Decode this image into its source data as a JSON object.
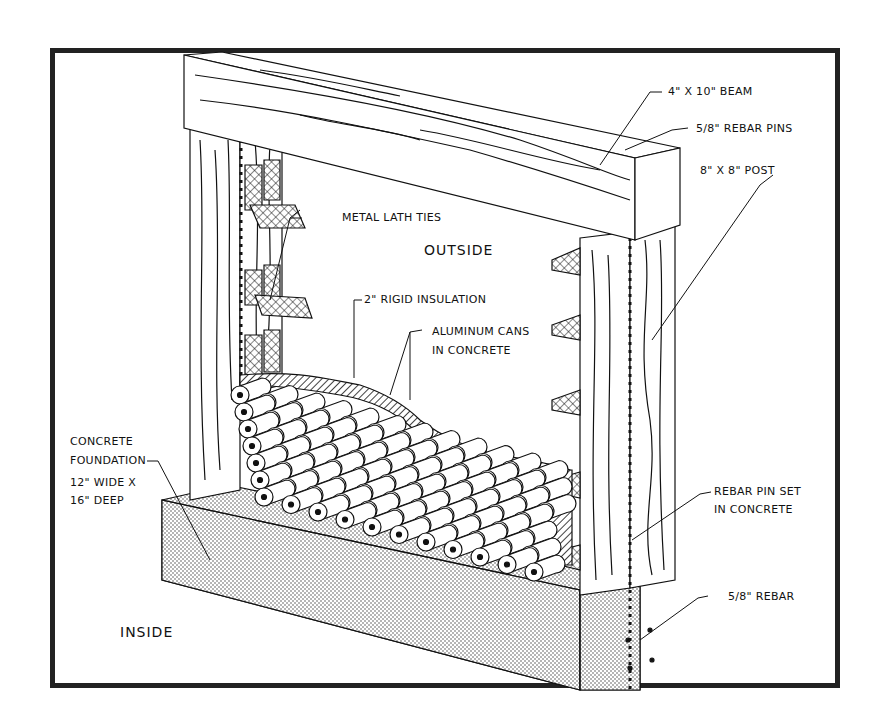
{
  "diagram": {
    "labels": {
      "beam": "4\" X 10\" BEAM",
      "rebar_pins": "5/8\" REBAR PINS",
      "post": "8\" X 8\" POST",
      "metal_lath_ties": "METAL LATH TIES",
      "outside": "OUTSIDE",
      "rigid_insulation": "2\" RIGID INSULATION",
      "aluminum_cans_line1": "ALUMINUM CANS",
      "aluminum_cans_line2": "IN CONCRETE",
      "foundation_line1": "CONCRETE",
      "foundation_line2": "FOUNDATION",
      "foundation_dim1": "12\" WIDE X",
      "foundation_dim2": "16\" DEEP",
      "rebar_pin_set_line1": "REBAR PIN SET",
      "rebar_pin_set_line2": "IN CONCRETE",
      "rebar": "5/8\" REBAR",
      "inside": "INSIDE"
    },
    "colors": {
      "ink": "#111111",
      "frame": "#222222",
      "background": "#ffffff"
    }
  }
}
